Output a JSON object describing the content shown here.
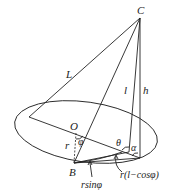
{
  "figure": {
    "points": {
      "apex": "C",
      "center": "O",
      "base_point": "B"
    },
    "segment_labels": {
      "slant": "L",
      "line_l": "l",
      "height": "h",
      "radius": "r"
    },
    "angle_labels": {
      "phi": "φ",
      "theta": "θ",
      "alpha": "α"
    },
    "annotations": {
      "r_sin_phi": "rsinφ",
      "r_one_minus_cos_phi": "r(l−cosφ)"
    }
  }
}
